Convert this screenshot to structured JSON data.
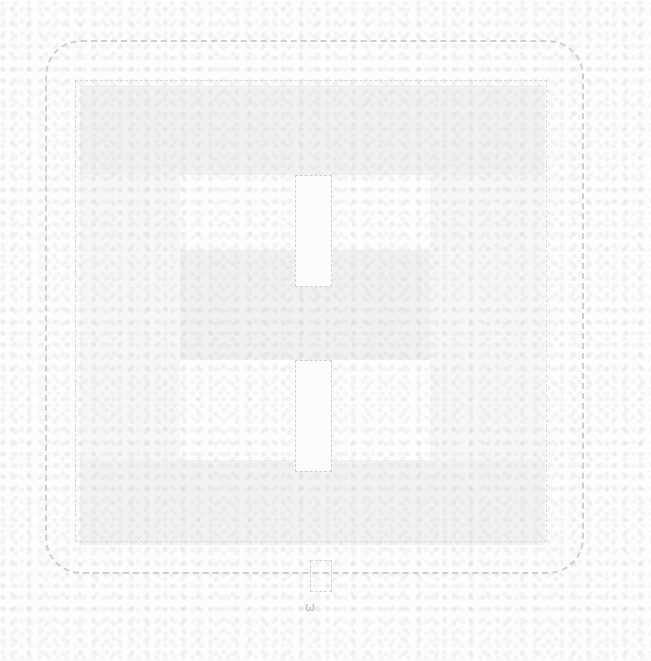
{
  "diagram": {
    "title": "",
    "colors": {
      "stroke": "#c8c8c8",
      "fill": "#e4e4e4"
    },
    "elements": [
      {
        "name": "outer-frame",
        "shape": "rounded-rect"
      },
      {
        "name": "inner-frame",
        "shape": "rect"
      },
      {
        "name": "top-slot",
        "shape": "rect"
      },
      {
        "name": "bottom-slot",
        "shape": "rect"
      },
      {
        "name": "bottom-tab",
        "shape": "rect"
      }
    ],
    "footer_mark": "ω"
  }
}
